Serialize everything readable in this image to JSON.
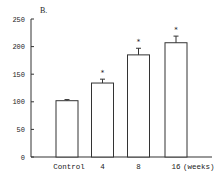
{
  "chart_data": {
    "type": "bar",
    "panel_label": "B.",
    "title": "",
    "xlabel": "(weeks)",
    "ylabel": "",
    "categories": [
      "Control",
      "4",
      "8",
      "16"
    ],
    "values": [
      102,
      134,
      185,
      207
    ],
    "error_upper": [
      2,
      7,
      12,
      12
    ],
    "significance": [
      "",
      "*",
      "*",
      "*"
    ],
    "ylim": [
      0,
      250
    ],
    "yticks": [
      0,
      50,
      100,
      150,
      200,
      250
    ],
    "grid": false,
    "legend": null,
    "bar_fill": "#ffffff",
    "bar_stroke": "#333333"
  }
}
